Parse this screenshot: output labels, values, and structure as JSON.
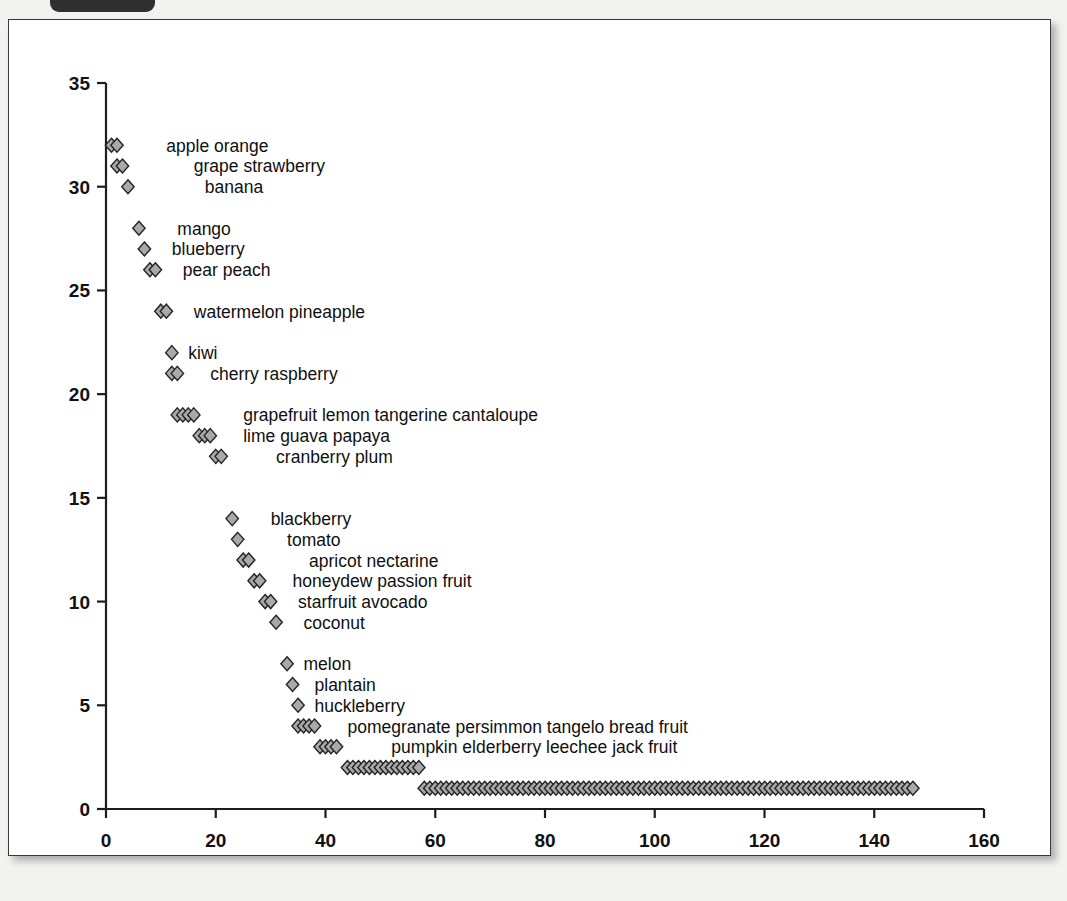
{
  "window": {
    "tag_label": ""
  },
  "chart_data": {
    "type": "scatter",
    "title": "",
    "subtitle": "",
    "xlabel": "",
    "ylabel": "",
    "xlim": [
      0,
      160
    ],
    "ylim": [
      0,
      35
    ],
    "xticks": [
      0,
      20,
      40,
      60,
      80,
      100,
      120,
      140,
      160
    ],
    "yticks": [
      0,
      5,
      10,
      15,
      20,
      25,
      30,
      35
    ],
    "xtick_labels": [
      "0",
      "20",
      "40",
      "60",
      "80",
      "100",
      "120",
      "140",
      "160"
    ],
    "ytick_labels": [
      "0",
      "5",
      "10",
      "15",
      "20",
      "25",
      "30",
      "35"
    ],
    "grid": false,
    "legend": false,
    "marker": "diamond",
    "marker_fill": "#a9a9a9",
    "marker_edge": "#232323",
    "rows": [
      {
        "y": 32,
        "x_start": 1,
        "count": 2,
        "label": "apple  orange",
        "label_x": 11
      },
      {
        "y": 31,
        "x_start": 2,
        "count": 2,
        "label": "grape  strawberry",
        "label_x": 16
      },
      {
        "y": 30,
        "x_start": 4,
        "count": 1,
        "label": "banana",
        "label_x": 18
      },
      {
        "y": 28,
        "x_start": 6,
        "count": 1,
        "label": "mango",
        "label_x": 13
      },
      {
        "y": 27,
        "x_start": 7,
        "count": 1,
        "label": "blueberry",
        "label_x": 12
      },
      {
        "y": 26,
        "x_start": 8,
        "count": 2,
        "label": "pear  peach",
        "label_x": 14
      },
      {
        "y": 24,
        "x_start": 10,
        "count": 2,
        "label": "watermelon  pineapple",
        "label_x": 16
      },
      {
        "y": 22,
        "x_start": 12,
        "count": 1,
        "label": "kiwi",
        "label_x": 15
      },
      {
        "y": 21,
        "x_start": 12,
        "count": 2,
        "label": "cherry  raspberry",
        "label_x": 19
      },
      {
        "y": 19,
        "x_start": 13,
        "count": 4,
        "label": "grapefruit  lemon  tangerine  cantaloupe",
        "label_x": 25
      },
      {
        "y": 18,
        "x_start": 17,
        "count": 3,
        "label": "lime  guava  papaya",
        "label_x": 25
      },
      {
        "y": 17,
        "x_start": 20,
        "count": 2,
        "label": "cranberry  plum",
        "label_x": 31
      },
      {
        "y": 14,
        "x_start": 23,
        "count": 1,
        "label": "blackberry",
        "label_x": 30
      },
      {
        "y": 13,
        "x_start": 24,
        "count": 1,
        "label": "tomato",
        "label_x": 33
      },
      {
        "y": 12,
        "x_start": 25,
        "count": 2,
        "label": "apricot  nectarine",
        "label_x": 37
      },
      {
        "y": 11,
        "x_start": 27,
        "count": 2,
        "label": "honeydew  passion fruit",
        "label_x": 34
      },
      {
        "y": 10,
        "x_start": 29,
        "count": 2,
        "label": "starfruit  avocado",
        "label_x": 35
      },
      {
        "y": 9,
        "x_start": 31,
        "count": 1,
        "label": "coconut",
        "label_x": 36
      },
      {
        "y": 7,
        "x_start": 33,
        "count": 1,
        "label": "melon",
        "label_x": 36
      },
      {
        "y": 6,
        "x_start": 34,
        "count": 1,
        "label": "plantain",
        "label_x": 38
      },
      {
        "y": 5,
        "x_start": 35,
        "count": 1,
        "label": "huckleberry",
        "label_x": 38
      },
      {
        "y": 4,
        "x_start": 35,
        "count": 4,
        "label": "pomegranate  persimmon  tangelo  bread fruit",
        "label_x": 44
      },
      {
        "y": 3,
        "x_start": 39,
        "count": 4,
        "label": "pumpkin  elderberry  leechee  jack fruit",
        "label_x": 52
      },
      {
        "y": 2,
        "x_start": 44,
        "count": 14,
        "label": "",
        "label_x": 0
      },
      {
        "y": 1,
        "x_start": 58,
        "count": 90,
        "label": "",
        "label_x": 0
      }
    ]
  }
}
